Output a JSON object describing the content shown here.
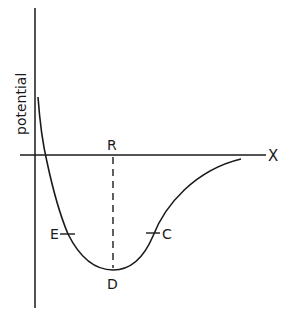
{
  "diagram": {
    "type": "potential-energy-curve",
    "y_axis_label": "potential",
    "x_axis_label": "X",
    "points": {
      "R": "R",
      "D": "D",
      "E": "E",
      "C": "C"
    },
    "colors": {
      "line": "#1a1a1a",
      "background": "#ffffff"
    }
  }
}
